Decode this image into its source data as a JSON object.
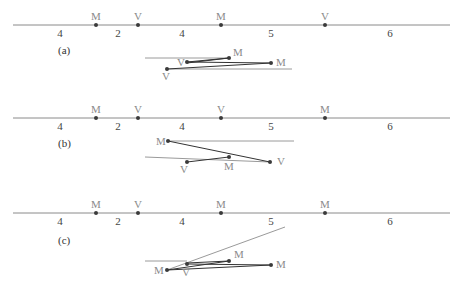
{
  "colors": {
    "axis": "#8a8a8a",
    "dot": "#3a3a3a",
    "edge": "#333333",
    "ref_line": "#9a9a9a",
    "label": "#8a8a8a"
  },
  "panels": [
    {
      "label": "(a)",
      "axis_points": [
        {
          "label": "M",
          "x": 96
        },
        {
          "label": "V",
          "x": 138
        },
        {
          "label": "M",
          "x": 221
        },
        {
          "label": "V",
          "x": 325
        }
      ],
      "segment_numbers": [
        {
          "text": "4",
          "x": 60
        },
        {
          "text": "2",
          "x": 118
        },
        {
          "text": "4",
          "x": 182
        },
        {
          "text": "5",
          "x": 271
        },
        {
          "text": "6",
          "x": 390
        }
      ],
      "figure_labels": [
        "M",
        "V",
        "M",
        "V"
      ]
    },
    {
      "label": "(b)",
      "axis_points": [
        {
          "label": "M",
          "x": 96
        },
        {
          "label": "V",
          "x": 138
        },
        {
          "label": "V",
          "x": 221
        },
        {
          "label": "M",
          "x": 325
        }
      ],
      "segment_numbers": [
        {
          "text": "4",
          "x": 60
        },
        {
          "text": "2",
          "x": 118
        },
        {
          "text": "4",
          "x": 182
        },
        {
          "text": "5",
          "x": 271
        },
        {
          "text": "6",
          "x": 390
        }
      ],
      "figure_labels": [
        "M",
        "V",
        "M",
        "V"
      ]
    },
    {
      "label": "(c)",
      "axis_points": [
        {
          "label": "M",
          "x": 96
        },
        {
          "label": "V",
          "x": 138
        },
        {
          "label": "M",
          "x": 221
        },
        {
          "label": "M",
          "x": 325
        }
      ],
      "segment_numbers": [
        {
          "text": "4",
          "x": 60
        },
        {
          "text": "2",
          "x": 118
        },
        {
          "text": "4",
          "x": 182
        },
        {
          "text": "5",
          "x": 271
        },
        {
          "text": "6",
          "x": 390
        }
      ],
      "figure_labels": [
        "M",
        "M",
        "V",
        "M"
      ]
    }
  ]
}
